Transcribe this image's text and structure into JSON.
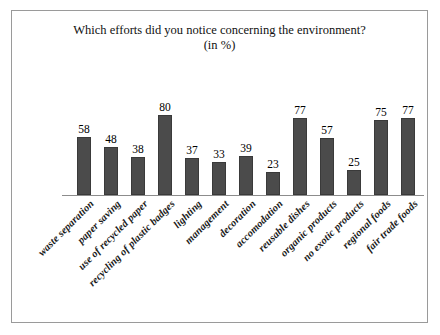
{
  "chart_data": {
    "type": "bar",
    "title": "Which efforts did you notice concerning the environment?",
    "subtitle": "(in %)",
    "xlabel": "",
    "ylabel": "",
    "ylim": [
      0,
      80
    ],
    "grid": false,
    "legend": "none",
    "value_unit": "%",
    "categories": [
      "waste separation",
      "paper saving",
      "use of recycled paper",
      "recycling of plastic badges",
      "lighting",
      "management",
      "decoration",
      "accomodation",
      "reusable dishes",
      "organic products",
      "no exotic products",
      "regional foods",
      "fair trade foods"
    ],
    "values": [
      58,
      48,
      38,
      80,
      37,
      33,
      39,
      23,
      77,
      57,
      25,
      75,
      77
    ],
    "bar_color": "#4b4b4b",
    "axis_color": "#8c8c8c",
    "background_color": "#ffffff",
    "border_color": "#9a9a9a"
  }
}
